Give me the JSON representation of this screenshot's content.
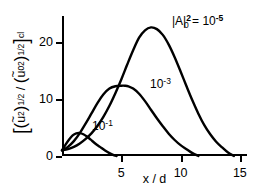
{
  "chart_data": {
    "type": "line",
    "title": "",
    "xlabel": "x / d",
    "ylabel": "[(u~2)1/2 / (u~02)1/2]cl",
    "ylabel_parts": {
      "open_bracket": "[",
      "close_bracket": "]",
      "subscript_cl": "cl",
      "numerator_var": "u",
      "numerator_tilde": "~",
      "numerator_exponent": "2",
      "numerator_power": "1/2",
      "denominator_var": "u",
      "denominator_tilde": "~",
      "denominator_subscript": "0",
      "denominator_exponent": "2",
      "denominator_power": "1/2",
      "divider": "/"
    },
    "xlim": [
      0,
      15.6
    ],
    "ylim": [
      0,
      24.5
    ],
    "xticks": [
      5,
      10,
      15
    ],
    "xticklabels": [
      "5",
      "10",
      "15"
    ],
    "yticks": [
      0,
      10,
      20
    ],
    "yticklabels": [
      "0",
      "10",
      "20"
    ],
    "grid": false,
    "legend_position": "inline-annotations",
    "line_color": "#000000",
    "background_color": "#ffffff",
    "series": [
      {
        "name": "|A|0^2 = 10^-5",
        "label_text": "|A|",
        "label_sup": "2",
        "label_sub": "0",
        "label_eq": "= 10",
        "label_exp": "-5",
        "peak_x": 7.5,
        "peak_y": 22.5,
        "x": [
          0.0,
          0.5,
          1.0,
          1.5,
          2.0,
          2.5,
          3.0,
          3.5,
          4.0,
          4.5,
          5.0,
          5.5,
          6.0,
          6.5,
          7.0,
          7.5,
          8.0,
          8.5,
          9.0,
          9.5,
          10.0,
          10.5,
          11.0,
          11.5,
          12.0,
          12.5,
          13.0,
          13.5,
          14.0,
          14.5
        ],
        "y": [
          1.0,
          1.2,
          1.6,
          2.2,
          3.0,
          4.0,
          5.3,
          6.9,
          8.8,
          11.0,
          13.4,
          16.0,
          18.5,
          20.7,
          22.0,
          22.5,
          22.2,
          21.2,
          19.5,
          17.3,
          14.8,
          12.2,
          9.7,
          7.4,
          5.4,
          3.8,
          2.5,
          1.5,
          0.6,
          0.0
        ]
      },
      {
        "name": "10^-3",
        "label_text": "10",
        "label_exp": "-3",
        "peak_x": 5.3,
        "peak_y": 12.3,
        "x": [
          0.0,
          0.5,
          1.0,
          1.5,
          2.0,
          2.5,
          3.0,
          3.5,
          4.0,
          4.5,
          5.0,
          5.3,
          5.6,
          6.0,
          6.5,
          7.0,
          7.5,
          8.0,
          8.5,
          9.0,
          9.5,
          10.0,
          10.5,
          11.0,
          11.5
        ],
        "y": [
          1.0,
          1.6,
          2.6,
          4.0,
          5.7,
          7.5,
          9.3,
          10.8,
          11.8,
          12.2,
          12.3,
          12.3,
          12.2,
          11.8,
          10.9,
          9.6,
          8.1,
          6.6,
          5.2,
          3.9,
          2.8,
          1.9,
          1.2,
          0.5,
          0.0
        ]
      },
      {
        "name": "10^-1",
        "label_text": "10",
        "label_exp": "-1",
        "peak_x": 1.5,
        "peak_y": 4.0,
        "x": [
          0.0,
          0.3,
          0.6,
          0.9,
          1.2,
          1.5,
          1.8,
          2.1,
          2.4,
          2.8,
          3.2,
          3.6,
          4.0,
          4.4,
          4.6
        ],
        "y": [
          1.0,
          2.0,
          2.9,
          3.6,
          3.95,
          4.0,
          3.8,
          3.4,
          2.9,
          2.2,
          1.6,
          1.0,
          0.5,
          0.1,
          0.0
        ]
      }
    ]
  }
}
